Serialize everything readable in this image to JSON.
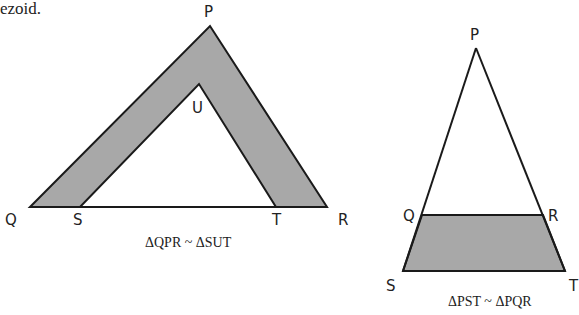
{
  "header_fragment": "ezoid.",
  "colors": {
    "fill": "#a8a8a8",
    "stroke": "#1a1a1a",
    "background": "#ffffff"
  },
  "figure_left": {
    "labels": {
      "P": "P",
      "U": "U",
      "Q": "Q",
      "S": "S",
      "T": "T",
      "R": "R"
    },
    "caption": "ΔQPR ~ ΔSUT"
  },
  "figure_right": {
    "labels": {
      "P": "P",
      "Q": "Q",
      "R": "R",
      "S": "S",
      "T": "T"
    },
    "caption": "ΔPST ~ ΔPQR"
  }
}
